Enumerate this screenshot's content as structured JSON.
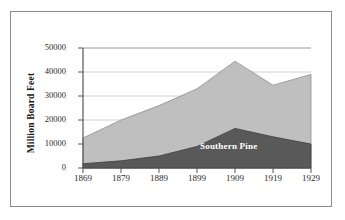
{
  "figure": {
    "background_color": "#ffffff",
    "frame_color": "#8a8a8a"
  },
  "chart_data": {
    "type": "area",
    "stacked": true,
    "title": "",
    "subtitle": "",
    "xlabel": "",
    "ylabel": "Million Board Feet",
    "categories": [
      "1869",
      "1879",
      "1889",
      "1899",
      "1909",
      "1919",
      "1929"
    ],
    "x": [
      1869,
      1879,
      1889,
      1899,
      1909,
      1919,
      1929
    ],
    "series": [
      {
        "name": "Southern Pine",
        "color": "#595959",
        "values": [
          1800,
          3000,
          5000,
          9000,
          16500,
          13000,
          10000
        ]
      },
      {
        "name": "Other",
        "color": "#bfbfbf",
        "values": [
          10700,
          17000,
          21000,
          24000,
          28000,
          21500,
          29000
        ]
      }
    ],
    "totals": [
      12500,
      20000,
      26000,
      33000,
      44500,
      34500,
      39000
    ],
    "ylim": [
      0,
      50000
    ],
    "xlim": [
      1869,
      1929
    ],
    "yticks": [
      0,
      10000,
      20000,
      30000,
      40000,
      50000
    ],
    "ytick_labels": [
      "0",
      "10000",
      "20000",
      "30000",
      "40000",
      "50000"
    ],
    "xtick_labels": [
      "1869",
      "1879",
      "1889",
      "1899",
      "1909",
      "1919",
      "1929"
    ],
    "grid": true,
    "grid_axis": "y",
    "grid_color": "#c8c8c8",
    "legend": "inline-annotation",
    "annotations": [
      {
        "text": "Southern Pine",
        "x": 1909,
        "y": 11000,
        "color": "#ffffff"
      }
    ],
    "axis_color": "#555555"
  }
}
